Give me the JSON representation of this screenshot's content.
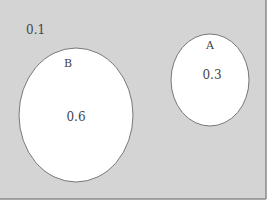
{
  "diagram": {
    "type": "venn",
    "background_color": "#d4d4d4",
    "circle_fill": "#ffffff",
    "circle_stroke": "#777777",
    "universe": {
      "label": "0.1"
    },
    "sets": [
      {
        "name": "B",
        "value": "0.6"
      },
      {
        "name": "A",
        "value": "0.3"
      }
    ]
  }
}
